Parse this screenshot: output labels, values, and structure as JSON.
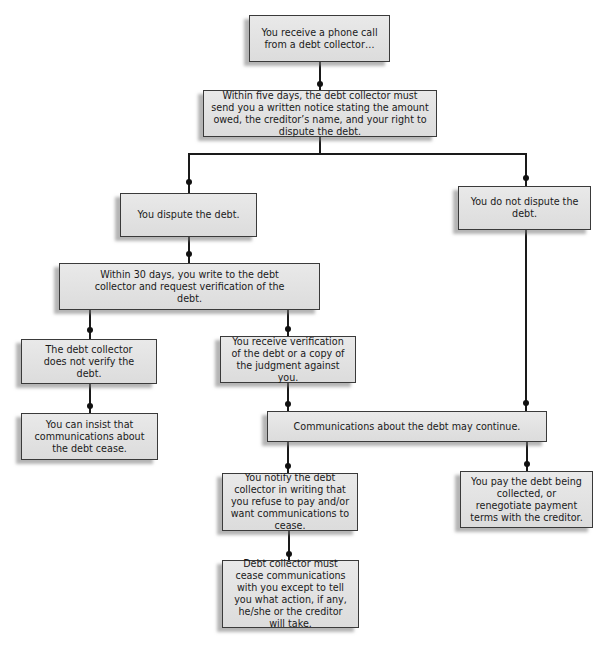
{
  "flowchart": {
    "nodes": [
      {
        "id": "phone_call",
        "text": "You receive a phone call from a debt collector…"
      },
      {
        "id": "written_notice",
        "text": "Within five days, the debt collector must send you a written notice stating the amount owed, the creditor’s name, and your right to dispute the debt."
      },
      {
        "id": "dispute",
        "text": "You dispute the debt."
      },
      {
        "id": "no_dispute",
        "text": "You do not dispute the debt."
      },
      {
        "id": "request_verification",
        "text": "Within 30 days, you write to the debt collector and request verification of the debt."
      },
      {
        "id": "not_verified",
        "text": "The debt collector does not verify the debt."
      },
      {
        "id": "verification_received",
        "text": "You receive verification of the debt or a copy of the judgment against you."
      },
      {
        "id": "insist_cease",
        "text": "You can insist that communications about the debt cease."
      },
      {
        "id": "may_continue",
        "text": "Communications about the debt may continue."
      },
      {
        "id": "notify_refuse",
        "text": "You notify the debt collector in writing that you refuse to pay and/or want communications to cease."
      },
      {
        "id": "pay_debt",
        "text": "You pay the debt being collected, or renegotiate payment terms with the creditor."
      },
      {
        "id": "must_cease",
        "text": "Debt collector must cease communications with you except to tell you what action, if any, he/she or the creditor will take."
      }
    ],
    "edges": [
      [
        "phone_call",
        "written_notice"
      ],
      [
        "written_notice",
        "dispute"
      ],
      [
        "written_notice",
        "no_dispute"
      ],
      [
        "dispute",
        "request_verification"
      ],
      [
        "request_verification",
        "not_verified"
      ],
      [
        "request_verification",
        "verification_received"
      ],
      [
        "not_verified",
        "insist_cease"
      ],
      [
        "verification_received",
        "may_continue"
      ],
      [
        "no_dispute",
        "may_continue"
      ],
      [
        "may_continue",
        "notify_refuse"
      ],
      [
        "may_continue",
        "pay_debt"
      ],
      [
        "notify_refuse",
        "must_cease"
      ]
    ]
  }
}
